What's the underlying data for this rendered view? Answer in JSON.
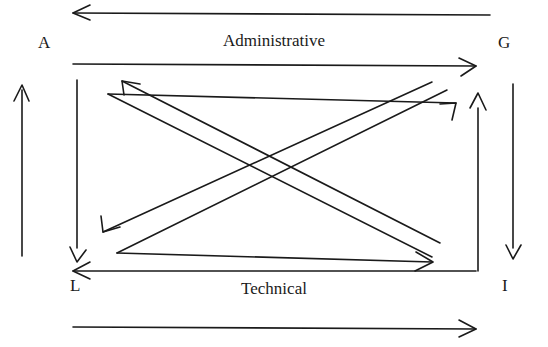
{
  "diagram": {
    "background_color": "#ffffff",
    "stroke_color": "#1a1a1a",
    "corner_labels": {
      "top_left": "A",
      "top_right": "G",
      "bottom_left": "L",
      "bottom_right": "I"
    },
    "side_labels": {
      "top": "Administrative",
      "bottom": "Technical"
    },
    "outer_arrows": [
      {
        "name": "outer-top-arrow",
        "direction": "left",
        "orientation": "horizontal"
      },
      {
        "name": "outer-bottom-arrow",
        "direction": "right",
        "orientation": "horizontal"
      },
      {
        "name": "outer-left-arrow",
        "direction": "up",
        "orientation": "vertical"
      },
      {
        "name": "outer-right-arrow",
        "direction": "down",
        "orientation": "vertical"
      }
    ],
    "box_arrows": [
      {
        "name": "box-top-arrow",
        "direction": "right",
        "orientation": "horizontal"
      },
      {
        "name": "box-bottom-arrow",
        "direction": "left",
        "orientation": "horizontal"
      },
      {
        "name": "box-left-arrow",
        "direction": "down",
        "orientation": "vertical"
      },
      {
        "name": "box-right-arrow",
        "direction": "up",
        "orientation": "vertical"
      }
    ],
    "diagonal_arrows": [
      {
        "name": "diagonal-upper-left-arrow",
        "direction": "up-left",
        "from": "bottom-right",
        "to": "top-left"
      },
      {
        "name": "diagonal-lower-left-arrow",
        "direction": "down-left",
        "from": "top-right",
        "to": "bottom-left"
      },
      {
        "name": "diagonal-upper-right-arrow",
        "direction": "up-right",
        "from": "bottom-left",
        "to": "top-right"
      },
      {
        "name": "diagonal-lower-right-arrow",
        "direction": "down-right",
        "from": "top-left",
        "to": "bottom-right"
      }
    ]
  }
}
